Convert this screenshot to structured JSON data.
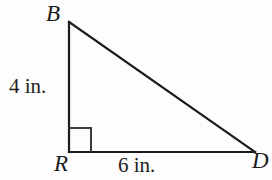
{
  "figure": {
    "kind": "right-triangle",
    "name": "triangle BRD",
    "background_color": "#fdfdfd",
    "stroke_color": "#1b1b1b",
    "stroke_width": 2,
    "canvas": {
      "width": 272,
      "height": 180
    },
    "vertices": [
      {
        "id": "B",
        "label": "B",
        "x": 69,
        "y": 22,
        "label_x": 46,
        "label_y": 2
      },
      {
        "id": "R",
        "label": "R",
        "x": 69,
        "y": 152,
        "label_x": 54,
        "label_y": 152
      },
      {
        "id": "D",
        "label": "D",
        "x": 255,
        "y": 152,
        "label_x": 252,
        "label_y": 149
      }
    ],
    "sides": [
      {
        "id": "BR",
        "from": "B",
        "to": "R",
        "label": "4 in.",
        "value": 4,
        "unit": "in.",
        "label_x": 9,
        "label_y": 76
      },
      {
        "id": "RD",
        "from": "R",
        "to": "D",
        "label": "6 in.",
        "value": 6,
        "unit": "in.",
        "label_x": 118,
        "label_y": 155
      },
      {
        "id": "BD",
        "from": "B",
        "to": "D",
        "label": "",
        "value": null,
        "unit": "",
        "label_x": null,
        "label_y": null
      }
    ],
    "right_angle": {
      "at_vertex": "R",
      "marker": "square",
      "size": 22,
      "x": 69,
      "y": 152
    }
  }
}
